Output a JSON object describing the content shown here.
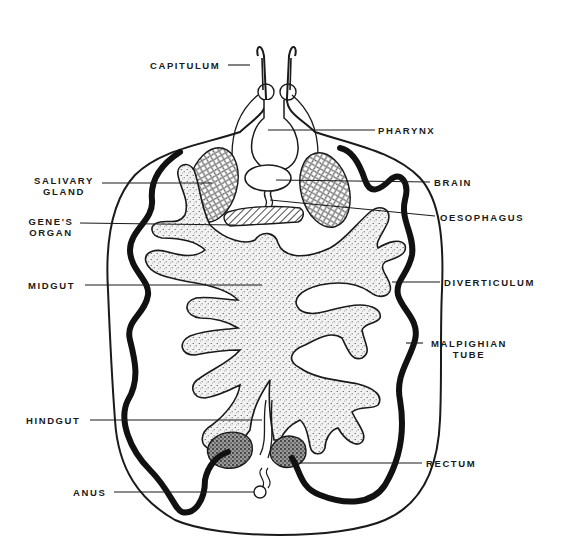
{
  "figure": {
    "ink_color": "#1a1a1a",
    "stipple_fill": "#e9e9e9",
    "background": "#ffffff"
  },
  "labels": {
    "capitulum": "CAPITULUM",
    "pharynx": "PHARYNX",
    "salivary_gland_1": "SALIVARY",
    "salivary_gland_2": "GLAND",
    "brain": "BRAIN",
    "genes_organ_1": "GENE'S",
    "genes_organ_2": "ORGAN",
    "oesophagus": "OESOPHAGUS",
    "midgut": "MIDGUT",
    "diverticulum": "DIVERTICULUM",
    "malpighian_1": "MALPIGHIAN",
    "malpighian_2": "TUBE",
    "hindgut": "HINDGUT",
    "rectum": "RECTUM",
    "anus": "ANUS"
  }
}
